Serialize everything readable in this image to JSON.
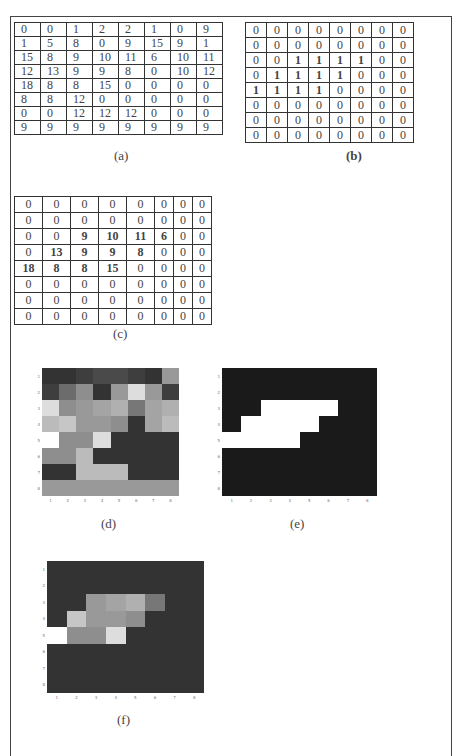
{
  "figure": {
    "captions": {
      "a": "(a)",
      "b": "(b)",
      "c": "(c)",
      "d": "(d)",
      "e": "(e)",
      "f": "(f)"
    },
    "matrix_a": [
      [
        0,
        0,
        1,
        2,
        2,
        1,
        0,
        9
      ],
      [
        1,
        5,
        8,
        0,
        9,
        15,
        9,
        1
      ],
      [
        15,
        8,
        9,
        10,
        11,
        6,
        10,
        11
      ],
      [
        12,
        13,
        9,
        9,
        8,
        0,
        10,
        12
      ],
      [
        18,
        8,
        8,
        15,
        0,
        0,
        0,
        0
      ],
      [
        8,
        8,
        12,
        0,
        0,
        0,
        0,
        0
      ],
      [
        0,
        0,
        12,
        12,
        12,
        0,
        0,
        0
      ],
      [
        9,
        9,
        9,
        9,
        9,
        9,
        9,
        9
      ]
    ],
    "matrix_b": [
      [
        0,
        0,
        0,
        0,
        0,
        0,
        0,
        0
      ],
      [
        0,
        0,
        0,
        0,
        0,
        0,
        0,
        0
      ],
      [
        0,
        0,
        1,
        1,
        1,
        1,
        0,
        0
      ],
      [
        0,
        1,
        1,
        1,
        1,
        0,
        0,
        0
      ],
      [
        1,
        1,
        1,
        1,
        0,
        0,
        0,
        0
      ],
      [
        0,
        0,
        0,
        0,
        0,
        0,
        0,
        0
      ],
      [
        0,
        0,
        0,
        0,
        0,
        0,
        0,
        0
      ],
      [
        0,
        0,
        0,
        0,
        0,
        0,
        0,
        0
      ]
    ],
    "matrix_c": [
      [
        0,
        0,
        0,
        0,
        0,
        0,
        0,
        0
      ],
      [
        0,
        0,
        0,
        0,
        0,
        0,
        0,
        0
      ],
      [
        0,
        0,
        9,
        10,
        11,
        6,
        0,
        0
      ],
      [
        0,
        13,
        9,
        9,
        8,
        0,
        0,
        0
      ],
      [
        18,
        8,
        8,
        15,
        0,
        0,
        0,
        0
      ],
      [
        0,
        0,
        0,
        0,
        0,
        0,
        0,
        0
      ],
      [
        0,
        0,
        0,
        0,
        0,
        0,
        0,
        0
      ],
      [
        0,
        0,
        0,
        0,
        0,
        0,
        0,
        0
      ]
    ],
    "axis_ticks": [
      "1",
      "2",
      "3",
      "4",
      "5",
      "6",
      "7",
      "8"
    ],
    "image_colors": {
      "min": "#333333",
      "max": "#ffffff",
      "binary_off": "#1a1a1a",
      "binary_on": "#ffffff"
    },
    "value_max": 18
  }
}
